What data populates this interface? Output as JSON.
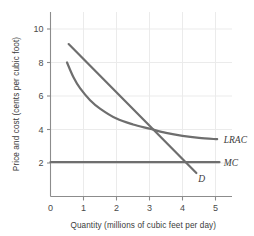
{
  "chart_data": {
    "type": "line",
    "title": "",
    "xlabel": "Quantity (millions of cubic feet per day)",
    "ylabel": "Price and cost (cents per cubic foot)",
    "xlim": [
      0,
      5.45
    ],
    "ylim": [
      0,
      11.0
    ],
    "xticks": [
      0,
      1,
      2,
      3,
      4,
      5
    ],
    "xtick_labels": [
      "0",
      "1",
      "2",
      "3",
      "4",
      "5"
    ],
    "yticks": [
      2,
      4,
      6,
      8,
      10
    ],
    "ytick_labels": [
      "2",
      "4",
      "6",
      "8",
      "10"
    ],
    "grid": true,
    "legend": "inline-right-labels",
    "series": [
      {
        "name": "LRAC",
        "label": "LRAC",
        "style": "curve",
        "color": "#6e6e6e",
        "points": [
          {
            "x": 0.5,
            "y": 8.0
          },
          {
            "x": 0.7,
            "y": 7.1
          },
          {
            "x": 0.9,
            "y": 6.45
          },
          {
            "x": 1.2,
            "y": 5.75
          },
          {
            "x": 1.5,
            "y": 5.25
          },
          {
            "x": 2.0,
            "y": 4.65
          },
          {
            "x": 2.5,
            "y": 4.3
          },
          {
            "x": 3.0,
            "y": 4.05
          },
          {
            "x": 3.5,
            "y": 3.8
          },
          {
            "x": 4.0,
            "y": 3.62
          },
          {
            "x": 4.5,
            "y": 3.5
          },
          {
            "x": 5.05,
            "y": 3.42
          }
        ]
      },
      {
        "name": "D",
        "label": "D",
        "style": "straight",
        "color": "#6e6e6e",
        "points": [
          {
            "x": 0.55,
            "y": 9.1
          },
          {
            "x": 4.42,
            "y": 1.4
          }
        ]
      },
      {
        "name": "MC",
        "label": "MC",
        "style": "horizontal",
        "color": "#6e6e6e",
        "points": [
          {
            "x": 0.0,
            "y": 2.05
          },
          {
            "x": 5.12,
            "y": 2.05
          }
        ]
      }
    ],
    "annotations": [
      {
        "name": "lrac-label",
        "text": "LRAC",
        "x": 5.25,
        "y": 3.42
      },
      {
        "name": "mc-label",
        "text": "MC",
        "x": 5.25,
        "y": 2.05
      },
      {
        "name": "d-label",
        "text": "D",
        "x": 4.48,
        "y": 1.05
      }
    ],
    "intersections": [
      {
        "series": [
          "D",
          "LRAC"
        ],
        "x": 3.0,
        "y": 4.05
      },
      {
        "series": [
          "D",
          "MC"
        ],
        "x": 4.0,
        "y": 2.05
      }
    ],
    "colors": {
      "line": "#6e6e6e",
      "axis": "#8c8c8c",
      "grid": "#ebebeb",
      "text": "#3b3b3b",
      "background": "#ffffff"
    }
  }
}
